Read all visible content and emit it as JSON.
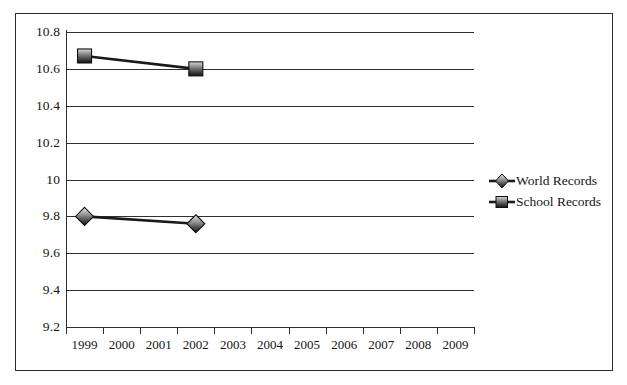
{
  "chart_data": {
    "type": "line",
    "title": "",
    "xlabel": "",
    "ylabel": "",
    "categories": [
      "1999",
      "2000",
      "2001",
      "2002",
      "2003",
      "2004",
      "2005",
      "2006",
      "2007",
      "2008",
      "2009"
    ],
    "ylim": [
      9.2,
      10.8
    ],
    "ytick_labels": [
      "10.8",
      "10.6",
      "10.4",
      "10.2",
      "10",
      "9.8",
      "9.6",
      "9.4",
      "9.2"
    ],
    "ytick_values": [
      10.8,
      10.6,
      10.4,
      10.2,
      10.0,
      9.8,
      9.6,
      9.4,
      9.2
    ],
    "grid": true,
    "legend_position": "right",
    "series": [
      {
        "name": "World Records",
        "marker": "diamond",
        "color": "#1a1a1a",
        "x": [
          "1999",
          "2002"
        ],
        "values": [
          9.8,
          9.76
        ]
      },
      {
        "name": "School Records",
        "marker": "square",
        "color": "#1a1a1a",
        "x": [
          "1999",
          "2002"
        ],
        "values": [
          10.67,
          10.6
        ]
      }
    ]
  },
  "legend": {
    "items": [
      {
        "label": "World Records",
        "marker": "diamond"
      },
      {
        "label": "School Records",
        "marker": "square"
      }
    ]
  },
  "colors": {
    "axis": "#2f2f2f",
    "text": "#141414",
    "frame": "#2b2b2b",
    "marker_light": "#e8e8e8",
    "marker_dark": "#1a1a1a",
    "background": "#ffffff"
  }
}
